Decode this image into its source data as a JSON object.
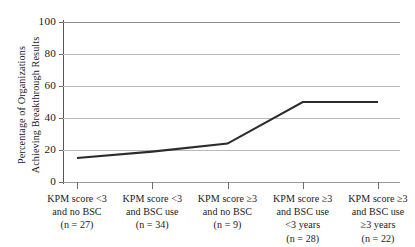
{
  "chart_data": {
    "type": "line",
    "title": "",
    "xlabel": "",
    "ylabel": "Percentage of Organizations Achieving Breakthrough Results",
    "ylabel_lines": [
      "Percentage of Organizations",
      "Achieving Breakthrough Results"
    ],
    "ylim": [
      0,
      100
    ],
    "yticks": [
      0,
      20,
      40,
      60,
      80,
      100
    ],
    "ytick_labels": [
      "0",
      "20",
      "40",
      "60",
      "80",
      "100"
    ],
    "grid": true,
    "grid_axis": "y",
    "legend": false,
    "legend_position": "none",
    "line_color": "#2b2b2b",
    "grid_color": "#b9b9b9",
    "axis_color": "#555555",
    "background": "#ffffff",
    "categories": [
      "KPM score <3 and no BSC (n = 27)",
      "KPM score <3 and BSC use (n = 34)",
      "KPM score ≥3 and no BSC (n = 9)",
      "KPM score ≥3 and BSC use <3 years (n = 28)",
      "KPM score ≥3 and BSC use ≥3 years (n = 22)"
    ],
    "category_lines": [
      [
        "KPM score <3",
        "and no BSC",
        "(n = 27)"
      ],
      [
        "KPM score <3",
        "and BSC use",
        "(n = 34)"
      ],
      [
        "KPM score ≥3",
        "and no BSC",
        "(n = 9)"
      ],
      [
        "KPM score ≥3",
        "and BSC use",
        "<3 years",
        "(n = 28)"
      ],
      [
        "KPM score ≥3",
        "and BSC use",
        "≥3 years",
        "(n = 22)"
      ]
    ],
    "sample_sizes": [
      27,
      34,
      9,
      28,
      22
    ],
    "values": [
      15,
      19,
      24,
      50,
      50
    ]
  }
}
